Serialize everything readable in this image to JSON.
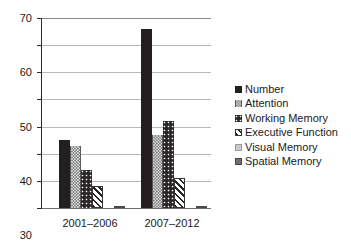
{
  "chart_data": {
    "type": "bar",
    "title": "",
    "xlabel": "",
    "ylabel": "",
    "ylim": [
      0,
      70
    ],
    "ytick_step": 10,
    "yticks": [
      "70",
      "60",
      "50",
      "40",
      "30",
      "20",
      "10",
      "0"
    ],
    "grid": true,
    "legend_position": "right",
    "categories": [
      "2001–2006",
      "2007–2012"
    ],
    "series": [
      {
        "name": "Number",
        "values": [
          25,
          66
        ],
        "pattern": "solid-dark",
        "color": "#231f20"
      },
      {
        "name": "Attention",
        "values": [
          23,
          27
        ],
        "pattern": "dot-gray",
        "color": "#8b8b8b"
      },
      {
        "name": "Working Memory",
        "values": [
          14,
          32
        ],
        "pattern": "dot-dark",
        "color": "#2a2526"
      },
      {
        "name": "Executive Function",
        "values": [
          8,
          11
        ],
        "pattern": "diagonal",
        "color": "#2a2526"
      },
      {
        "name": "Visual Memory",
        "values": [
          0,
          0
        ],
        "pattern": "light-gray",
        "color": "#c9c9c9"
      },
      {
        "name": "Spatial Memory",
        "values": [
          0.5,
          0.8
        ],
        "pattern": "mid-gray",
        "color": "#6f6f6f"
      }
    ]
  },
  "legend": {
    "items": [
      {
        "label": "Number"
      },
      {
        "label": "Attention"
      },
      {
        "label": "Working Memory"
      },
      {
        "label": "Executive Function"
      },
      {
        "label": "Visual Memory"
      },
      {
        "label": "Spatial Memory"
      }
    ]
  },
  "axis": {
    "y_max": 70,
    "y_min": 0,
    "y_step": 10
  }
}
